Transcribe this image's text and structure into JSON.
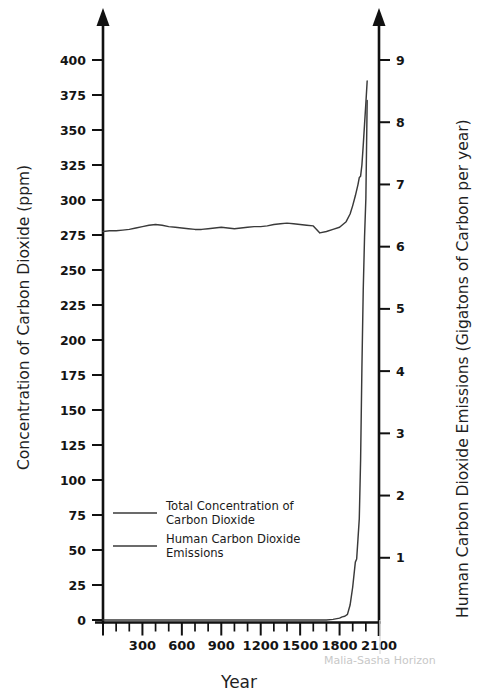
{
  "figure": {
    "watermark": "Malia-Sasha Horizon",
    "background": "#ffffff",
    "line_color": "#3a3a3a"
  },
  "axes": {
    "x": {
      "title": "Year",
      "ticks_labeled": [
        "300",
        "600",
        "900",
        "1200",
        "1500",
        "1800",
        "2100"
      ],
      "tick_values": [
        300,
        600,
        900,
        1200,
        1500,
        1800,
        2100
      ],
      "minor_step": 100,
      "range": [
        0,
        2100
      ]
    },
    "y_left": {
      "title": "Concentration of Carbon Dioxide (ppm)",
      "ticks": [
        "0",
        "25",
        "50",
        "75",
        "100",
        "125",
        "150",
        "175",
        "200",
        "225",
        "250",
        "275",
        "300",
        "325",
        "350",
        "375",
        "400"
      ],
      "range": [
        0,
        400
      ],
      "step": 25
    },
    "y_right": {
      "title": "Human Carbon Dioxide Emissions (Gigatons of Carbon per year)",
      "ticks": [
        "1",
        "2",
        "3",
        "4",
        "5",
        "6",
        "7",
        "8",
        "9"
      ],
      "range": [
        0,
        9
      ],
      "step": 1
    }
  },
  "legend": {
    "entries": [
      {
        "label_line1": "Total Concentration of",
        "label_line2": "Carbon Dioxide",
        "color": "#3a3a3a"
      },
      {
        "label_line1": "Human Carbon Dioxide",
        "label_line2": "Emissions",
        "color": "#3a3a3a"
      }
    ]
  },
  "chart_data": {
    "type": "line",
    "title": "",
    "subtitle": "",
    "xlabel": "Year",
    "ylabel": "Concentration of Carbon Dioxide (ppm)",
    "y2label": "Human Carbon Dioxide Emissions (Gigatons of Carbon per year)",
    "xlim": [
      0,
      2100
    ],
    "ylim": [
      0,
      400
    ],
    "y2lim": [
      0,
      9
    ],
    "grid": false,
    "legend_position": "inner-lower-left",
    "annotations": [
      "Malia-Sasha Horizon"
    ],
    "series": [
      {
        "name": "Total Concentration of Carbon Dioxide",
        "axis": "left",
        "units": "ppm",
        "x": [
          0,
          50,
          100,
          150,
          200,
          250,
          300,
          350,
          400,
          450,
          500,
          550,
          600,
          650,
          700,
          750,
          800,
          850,
          900,
          950,
          1000,
          1050,
          1100,
          1150,
          1200,
          1250,
          1300,
          1350,
          1400,
          1450,
          1500,
          1550,
          1600,
          1650,
          1700,
          1750,
          1800,
          1850,
          1880,
          1900,
          1920,
          1940,
          1950,
          1960,
          1970,
          1980,
          1990,
          2000,
          2010
        ],
        "y": [
          277.5,
          278,
          278,
          278.5,
          279,
          280,
          281,
          282,
          282.5,
          282,
          281,
          280.5,
          280,
          279.5,
          279,
          279,
          279.5,
          280,
          280.5,
          280,
          279.5,
          280,
          280.5,
          281,
          281,
          281.5,
          282.5,
          283,
          283.5,
          283,
          282.5,
          282,
          281.5,
          276.5,
          277.5,
          279,
          280.5,
          284.5,
          290,
          296,
          303,
          311,
          316,
          317,
          325,
          339,
          354,
          369,
          385
        ]
      },
      {
        "name": "Human Carbon Dioxide Emissions",
        "axis": "right",
        "units": "Gigatons of Carbon per year",
        "x": [
          0,
          200,
          400,
          600,
          800,
          1000,
          1200,
          1400,
          1600,
          1700,
          1750,
          1800,
          1820,
          1840,
          1860,
          1880,
          1900,
          1920,
          1930,
          1940,
          1950,
          1960,
          1970,
          1980,
          1990,
          2000,
          2010
        ],
        "y": [
          0,
          0,
          0,
          0,
          0,
          0,
          0,
          0,
          0,
          0,
          0.01,
          0.03,
          0.05,
          0.06,
          0.09,
          0.24,
          0.53,
          0.93,
          0.98,
          1.3,
          1.63,
          2.57,
          4.05,
          5.3,
          6.15,
          6.77,
          8.35
        ]
      }
    ]
  }
}
